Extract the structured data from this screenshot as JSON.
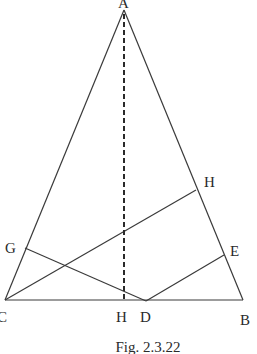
{
  "figure": {
    "caption": "Fig. 2.3.22",
    "points": {
      "A": {
        "label": "A",
        "x": 124,
        "y": 10
      },
      "B": {
        "label": "B",
        "x": 243,
        "y": 300
      },
      "C": {
        "label": "C",
        "x": 5,
        "y": 300
      },
      "D": {
        "label": "D",
        "x": 146,
        "y": 301
      },
      "E": {
        "label": "E",
        "x": 224,
        "y": 255
      },
      "G": {
        "label": "G",
        "x": 25,
        "y": 248
      },
      "H_on_AB": {
        "label": "H",
        "x": 196,
        "y": 190
      },
      "H_foot": {
        "label": "H",
        "x": 124,
        "y": 300
      }
    },
    "segments": [
      {
        "from": "A",
        "to": "B",
        "style": "solid"
      },
      {
        "from": "A",
        "to": "C",
        "style": "solid"
      },
      {
        "from": "C",
        "to": "B",
        "style": "solid"
      },
      {
        "from": "C",
        "to": "H_on_AB",
        "style": "solid"
      },
      {
        "from": "G",
        "to": "D",
        "style": "solid"
      },
      {
        "from": "D",
        "to": "E",
        "style": "solid"
      },
      {
        "from": "A",
        "to": "H_foot",
        "style": "dashed"
      }
    ]
  }
}
